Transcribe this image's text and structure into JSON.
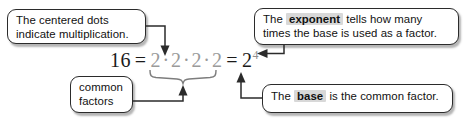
{
  "diagram": {
    "background_color": "#ffffff",
    "text_color": "#111111",
    "highlight_color": "#d8d8d8",
    "gray_factor_color": "#9a9a9a",
    "equation": {
      "result": "16",
      "equals_1": "=",
      "factors": [
        "2",
        "2",
        "2",
        "2"
      ],
      "dot_operator": "·",
      "equals_2": "=",
      "base": "2",
      "exponent": "4"
    },
    "callouts": [
      {
        "id": "centered-dots",
        "line1": "The centered dots",
        "line2": "indicate multiplication.",
        "points_to": "dot-operator"
      },
      {
        "id": "exponent",
        "line1_pre": "The ",
        "line1_highlight": "exponent",
        "line1_post": " tells how many",
        "line2": "times the base is used as a factor.",
        "points_to": "exponent-4"
      },
      {
        "id": "common-factors",
        "line1": "common",
        "line2": "factors",
        "points_to": "factor-brace"
      },
      {
        "id": "base",
        "text_pre": "The ",
        "text_highlight": "base",
        "text_post": " is the common factor.",
        "points_to": "base-2"
      }
    ]
  }
}
